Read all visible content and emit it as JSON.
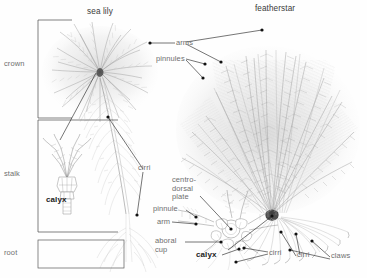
{
  "figure": {
    "kind": "scientific-anatomy-diagram",
    "background_color": "#ffffff",
    "ink_color": "#9a9a9a",
    "leader_color": "#2b2b2b",
    "label_color": "#6e6e6e",
    "emphasis_color": "#1b1b1b"
  },
  "titles": {
    "left_specimen": "sea lily",
    "right_specimen": "featherstar"
  },
  "body_regions": {
    "crown": "crown",
    "stalk": "stalk",
    "root": "root"
  },
  "sea_lily_labels": {
    "arms": "arms",
    "pinnules": "pinnules",
    "cirri": "cirri",
    "calyx": "calyx"
  },
  "featherstar_labels": {
    "centro_dorsal_plate": "centro-\ndorsal\nplate",
    "pinnule": "pinnule",
    "arm": "arm",
    "aboral_cup": "aboral\ncup",
    "calyx": "calyx",
    "cirri_calyx": "cirri",
    "cirri_spread": "cirri",
    "claws": "claws"
  }
}
